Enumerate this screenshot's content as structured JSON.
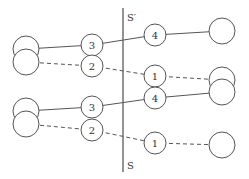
{
  "diagram": {
    "axis": {
      "x": 123,
      "y1": 8,
      "y2": 172,
      "top_label": "S′",
      "bottom_label": "S"
    },
    "colors": {
      "stroke": "#555555",
      "background": "#ffffff"
    },
    "nodes": [
      {
        "id": "top-left-upper",
        "cx": 26,
        "cy": 49,
        "r": 13,
        "label": ""
      },
      {
        "id": "top-left-lower",
        "cx": 26,
        "cy": 62,
        "r": 13,
        "label": ""
      },
      {
        "id": "top-3",
        "cx": 92,
        "cy": 45,
        "r": 11,
        "label": "3"
      },
      {
        "id": "top-2",
        "cx": 92,
        "cy": 66,
        "r": 11,
        "label": "2"
      },
      {
        "id": "top-4",
        "cx": 155,
        "cy": 35,
        "r": 11,
        "label": "4"
      },
      {
        "id": "top-1",
        "cx": 155,
        "cy": 76,
        "r": 11,
        "label": "1"
      },
      {
        "id": "top-right",
        "cx": 222,
        "cy": 31,
        "r": 13,
        "label": ""
      },
      {
        "id": "mid-right-upper",
        "cx": 222,
        "cy": 80,
        "r": 13,
        "label": ""
      },
      {
        "id": "mid-right-lower",
        "cx": 222,
        "cy": 92,
        "r": 13,
        "label": ""
      },
      {
        "id": "bottom-left-upper",
        "cx": 26,
        "cy": 111,
        "r": 13,
        "label": ""
      },
      {
        "id": "bottom-left-lower",
        "cx": 26,
        "cy": 124,
        "r": 13,
        "label": ""
      },
      {
        "id": "bottom-3",
        "cx": 92,
        "cy": 107,
        "r": 11,
        "label": "3"
      },
      {
        "id": "bottom-2",
        "cx": 92,
        "cy": 130,
        "r": 11,
        "label": "2"
      },
      {
        "id": "bottom-4",
        "cx": 155,
        "cy": 98,
        "r": 11,
        "label": "4"
      },
      {
        "id": "bottom-1",
        "cx": 155,
        "cy": 143,
        "r": 11,
        "label": "1"
      },
      {
        "id": "bottom-right",
        "cx": 222,
        "cy": 145,
        "r": 13,
        "label": ""
      }
    ],
    "edges": [
      {
        "from": "top-left-upper",
        "to": "top-3",
        "style": "solid"
      },
      {
        "from": "top-3",
        "to": "top-4",
        "style": "solid"
      },
      {
        "from": "top-4",
        "to": "top-right",
        "style": "solid"
      },
      {
        "from": "top-left-lower",
        "to": "top-2",
        "style": "dashed"
      },
      {
        "from": "top-2",
        "to": "top-1",
        "style": "dashed"
      },
      {
        "from": "top-1",
        "to": "mid-right-upper",
        "style": "dashed"
      },
      {
        "from": "bottom-left-upper",
        "to": "bottom-3",
        "style": "solid"
      },
      {
        "from": "bottom-3",
        "to": "bottom-4",
        "style": "solid"
      },
      {
        "from": "bottom-4",
        "to": "mid-right-lower",
        "style": "solid"
      },
      {
        "from": "bottom-left-lower",
        "to": "bottom-2",
        "style": "dashed"
      },
      {
        "from": "bottom-2",
        "to": "bottom-1",
        "style": "dashed"
      },
      {
        "from": "bottom-1",
        "to": "bottom-right",
        "style": "dashed"
      }
    ]
  }
}
